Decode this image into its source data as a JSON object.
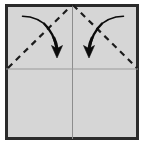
{
  "figure": {
    "caption": "",
    "canvas": {
      "width": 146,
      "height": 148
    },
    "background_color": "#ffffff"
  },
  "paper": {
    "name": "square-sheet",
    "fill_color": "#d6d6d6",
    "border_color": "#2b2b2b",
    "border_width": 3,
    "x": 5,
    "y": 4,
    "width": 134,
    "height": 136
  },
  "crease_lines": [
    {
      "name": "vertical-center-crease",
      "orientation": "vertical",
      "style": "solid",
      "color": "#8d8d8d",
      "width": 1,
      "x1": 72.5,
      "y1": 5.5,
      "x2": 72.5,
      "y2": 139
    },
    {
      "name": "horizontal-center-crease",
      "orientation": "horizontal",
      "style": "solid",
      "color": "#9a9a9a",
      "width": 1,
      "x1": 6,
      "y1": 69,
      "x2": 138,
      "y2": 69
    }
  ],
  "fold_lines": [
    {
      "name": "left-diagonal-fold-line",
      "style": "dashed",
      "color": "#1c1c1c",
      "width": 2.2,
      "dash": "6 5",
      "x1": 8,
      "y1": 68,
      "x2": 72,
      "y2": 5
    },
    {
      "name": "right-diagonal-fold-line",
      "style": "dashed",
      "color": "#1c1c1c",
      "width": 2.2,
      "dash": "6 5",
      "x1": 73,
      "y1": 5,
      "x2": 137,
      "y2": 68
    }
  ],
  "arrows": [
    {
      "name": "left-fold-arrow",
      "direction": "fold-right-down",
      "color": "#0b0b0b",
      "path": "M 22 16 C 40 17, 54 30, 57 49",
      "head": "M 57 58 L 51.5 45.5 L 57 48.5 L 62.5 45.5 Z",
      "stroke_start_width": 1.2,
      "stroke_end_width": 3.2
    },
    {
      "name": "right-fold-arrow",
      "direction": "fold-left-down",
      "color": "#0b0b0b",
      "path": "M 124 16 C 106 17, 92 30, 89 49",
      "head": "M 89 58 L 83.5 45.5 L 89 48.5 L 94.5 45.5 Z",
      "stroke_start_width": 1.2,
      "stroke_end_width": 3.2
    }
  ],
  "legend": {
    "dashed_meaning": "valley fold line",
    "arrow_meaning": "fold direction"
  }
}
